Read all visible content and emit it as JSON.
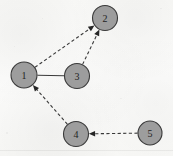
{
  "figure": {
    "kind": "directed-graph-diagram",
    "width": 173,
    "height": 156,
    "background_color": "#fafaf8",
    "node_fill_color": "#9d9d9d",
    "node_stroke_color": "#3a3a3a",
    "edge_color": "#3a3a3a",
    "label_color": "#232323"
  },
  "nodes": [
    {
      "id": "1",
      "label": "1",
      "cx": 24,
      "cy": 75,
      "r": 13.0
    },
    {
      "id": "2",
      "label": "2",
      "cx": 105,
      "cy": 18,
      "r": 12.5
    },
    {
      "id": "3",
      "label": "3",
      "cx": 77,
      "cy": 76,
      "r": 12.5
    },
    {
      "id": "4",
      "label": "4",
      "cx": 76,
      "cy": 134,
      "r": 12.5
    },
    {
      "id": "5",
      "label": "5",
      "cx": 150,
      "cy": 133,
      "r": 12.0
    }
  ],
  "edges": [
    {
      "id": "e1",
      "from": "1",
      "to": "2",
      "style": "dashed",
      "directed": true,
      "arrow_at": "2"
    },
    {
      "id": "e2",
      "from": "3",
      "to": "2",
      "style": "dashed",
      "directed": true,
      "arrow_at": "2"
    },
    {
      "id": "e3",
      "from": "1",
      "to": "3",
      "style": "solid",
      "directed": false,
      "arrow_at": ""
    },
    {
      "id": "e4",
      "from": "4",
      "to": "1",
      "style": "dashed",
      "directed": true,
      "arrow_at": "1"
    },
    {
      "id": "e5",
      "from": "5",
      "to": "4",
      "style": "dashed",
      "directed": true,
      "arrow_at": "4"
    }
  ]
}
